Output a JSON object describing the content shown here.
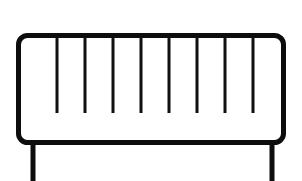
{
  "image": {
    "title": "Railing panel line drawing",
    "subject": "baluster-railing-panel",
    "style": "black-and-white-line-art",
    "background_color": "#ffffff",
    "stroke_color": "#0d0d0d",
    "width": 302,
    "height": 181
  },
  "frame": {
    "name": "rounded-rectangle-frame",
    "x": 18.5,
    "y": 35.5,
    "width": 265,
    "height": 107,
    "corner_radius": 9,
    "stroke_width": 5
  },
  "balusters": {
    "name": "vertical-bars",
    "count": 8,
    "stroke_width": 3,
    "top_y": 37,
    "bottom_y": 113,
    "x_positions": [
      57,
      85,
      113,
      141,
      169,
      197,
      225,
      253
    ]
  },
  "legs": {
    "name": "support-legs",
    "count": 2,
    "stroke_width": 5,
    "top_y": 142,
    "bottom_y": 181,
    "x_positions": [
      33,
      272
    ]
  },
  "labels": {
    "figure_caption": "Railing panel with eight balusters and two support legs",
    "frame_label": "Frame",
    "balusters_label": "Balusters",
    "legs_label": "Legs"
  }
}
